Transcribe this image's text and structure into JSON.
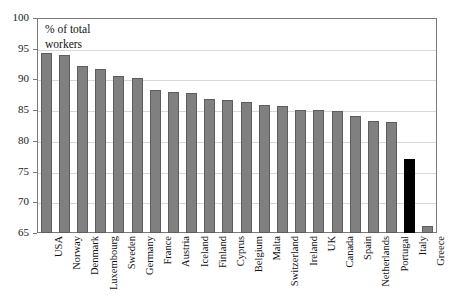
{
  "chart_data": {
    "type": "bar",
    "title": "",
    "subtitle": "",
    "annotation": "% of total workers",
    "xlabel": "",
    "ylabel": "",
    "ylim": [
      65,
      100
    ],
    "yticks": [
      65,
      70,
      75,
      80,
      85,
      90,
      95,
      100
    ],
    "grid": true,
    "legend": "none",
    "bar_color": "#808080",
    "highlight_color": "#000000",
    "highlight_category": "Italy",
    "categories": [
      "USA",
      "Norway",
      "Denmark",
      "Luxembourg",
      "Sweden",
      "Germany",
      "France",
      "Austria",
      "Iceland",
      "Finland",
      "Cyprus",
      "Belgium",
      "Malta",
      "Switzerland",
      "Ireland",
      "UK",
      "Canada",
      "Spain",
      "Netherlands",
      "Portugal",
      "Italy",
      "Greece"
    ],
    "values": [
      94.3,
      94.0,
      92.2,
      91.7,
      90.6,
      90.3,
      88.3,
      88.0,
      87.8,
      86.8,
      86.7,
      86.3,
      85.8,
      85.6,
      85.1,
      85.0,
      84.8,
      84.0,
      83.2,
      83.1,
      77.0,
      66.1
    ]
  },
  "axis": {
    "annotation_line1": "% of total",
    "annotation_line2": "workers",
    "ytick_labels": [
      "100",
      "95",
      "90",
      "85",
      "80",
      "75",
      "70",
      "65"
    ]
  }
}
